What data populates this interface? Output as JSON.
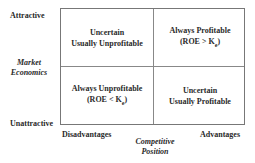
{
  "y_axis": {
    "title_line1": "Market",
    "title_line2": "Economics",
    "top_label": "Attractive",
    "bottom_label": "Unattractive"
  },
  "x_axis": {
    "title_line1": "Competitive",
    "title_line2": "Position",
    "left_label": "Disadvantages",
    "right_label": "Advantages"
  },
  "quadrants": {
    "top_left": {
      "line1": "Uncertain",
      "line2": "Usually Unprofitable"
    },
    "top_right": {
      "line1": "Always Profitable",
      "line2_prefix": "(ROE > K",
      "line2_sub": "e",
      "line2_suffix": ")"
    },
    "bottom_left": {
      "line1": "Always Unprofitable",
      "line2_prefix": "(ROE < K",
      "line2_sub": "e",
      "line2_suffix": ")"
    },
    "bottom_right": {
      "line1": "Uncertain",
      "line2": "Usually Profitable"
    }
  }
}
